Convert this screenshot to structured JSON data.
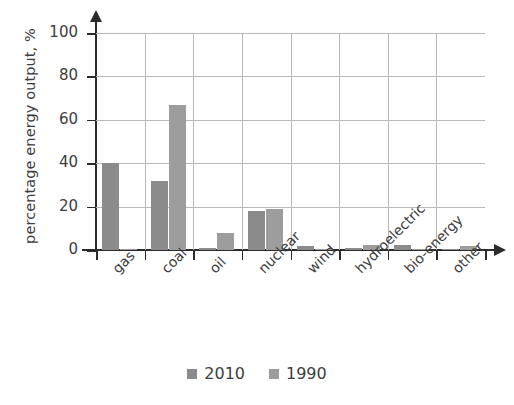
{
  "chart_data": {
    "type": "bar",
    "title": "",
    "xlabel": "",
    "ylabel": "percentage energy output, %",
    "ylim": [
      0,
      100
    ],
    "yticks": [
      0,
      20,
      40,
      60,
      80,
      100
    ],
    "grid": true,
    "legend_position": "bottom",
    "categories": [
      "gas",
      "coal",
      "oil",
      "nuclear",
      "wind",
      "hydroelectric",
      "bio-energy",
      "other"
    ],
    "series": [
      {
        "name": "2010",
        "color": "#8b8b8b",
        "values": [
          40,
          32,
          1,
          18,
          2,
          1,
          2.5,
          0.3
        ]
      },
      {
        "name": "1990",
        "color": "#9d9d9d",
        "values": [
          0.5,
          67,
          8,
          19,
          0.2,
          2.5,
          0.2,
          2
        ]
      }
    ]
  },
  "axis": {
    "y_tick_labels": [
      "0",
      "20",
      "40",
      "60",
      "80",
      "100"
    ],
    "y_title": "percentage energy output, %"
  },
  "legend": {
    "items": [
      {
        "label": "2010",
        "color": "#8b8b8b"
      },
      {
        "label": "1990",
        "color": "#9d9d9d"
      }
    ]
  }
}
